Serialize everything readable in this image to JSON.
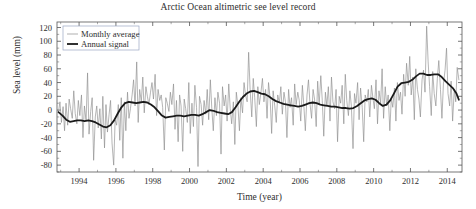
{
  "chart_data": {
    "type": "line",
    "title": "Arctic Ocean altimetric see level record",
    "xlabel": "Time (year)",
    "ylabel": "Sea level (mm)",
    "xlim": [
      1992.8,
      2014.8
    ],
    "ylim": [
      -90,
      128
    ],
    "grid": false,
    "legend_position": "top-left",
    "xticks": [
      1994,
      1996,
      1998,
      2000,
      2002,
      2004,
      2006,
      2008,
      2010,
      2012,
      2014
    ],
    "xtick_labels": [
      "1994",
      "1996",
      "1998",
      "2000",
      "2002",
      "2004",
      "2006",
      "2008",
      "2010",
      "2012",
      "2014"
    ],
    "yticks": [
      -80,
      -60,
      -40,
      -20,
      0,
      20,
      40,
      60,
      80,
      100,
      120
    ],
    "ytick_labels": [
      "-80",
      "-60",
      "-40",
      "-20",
      "0",
      "20",
      "40",
      "60",
      "80",
      "100",
      "120"
    ],
    "colors": {
      "monthly": "#8c8c8c",
      "annual": "#1a1a1a",
      "axis": "#555555",
      "background": "#ffffff"
    },
    "series": [
      {
        "name": "Monthly average",
        "style": "thin",
        "color": "#8c8c8c",
        "x": [
          1992.88,
          1992.96,
          1993.04,
          1993.13,
          1993.21,
          1993.29,
          1993.38,
          1993.46,
          1993.54,
          1993.63,
          1993.71,
          1993.79,
          1993.88,
          1993.96,
          1994.04,
          1994.13,
          1994.21,
          1994.29,
          1994.38,
          1994.46,
          1994.54,
          1994.63,
          1994.71,
          1994.79,
          1994.88,
          1994.96,
          1995.04,
          1995.13,
          1995.21,
          1995.29,
          1995.38,
          1995.46,
          1995.54,
          1995.63,
          1995.71,
          1995.79,
          1995.88,
          1995.96,
          1996.04,
          1996.13,
          1996.21,
          1996.29,
          1996.38,
          1996.46,
          1996.54,
          1996.63,
          1996.71,
          1996.79,
          1996.88,
          1996.96,
          1997.04,
          1997.13,
          1997.21,
          1997.29,
          1997.38,
          1997.46,
          1997.54,
          1997.63,
          1997.71,
          1997.79,
          1997.88,
          1997.96,
          1998.04,
          1998.13,
          1998.21,
          1998.29,
          1998.38,
          1998.46,
          1998.54,
          1998.63,
          1998.71,
          1998.79,
          1998.88,
          1998.96,
          1999.04,
          1999.13,
          1999.21,
          1999.29,
          1999.38,
          1999.46,
          1999.54,
          1999.63,
          1999.71,
          1999.79,
          1999.88,
          1999.96,
          2000.04,
          2000.13,
          2000.21,
          2000.29,
          2000.38,
          2000.46,
          2000.54,
          2000.63,
          2000.71,
          2000.79,
          2000.88,
          2000.96,
          2001.04,
          2001.13,
          2001.21,
          2001.29,
          2001.38,
          2001.46,
          2001.54,
          2001.63,
          2001.71,
          2001.79,
          2001.88,
          2001.96,
          2002.04,
          2002.13,
          2002.21,
          2002.29,
          2002.38,
          2002.46,
          2002.54,
          2002.63,
          2002.71,
          2002.79,
          2002.88,
          2002.96,
          2003.04,
          2003.13,
          2003.21,
          2003.29,
          2003.38,
          2003.46,
          2003.54,
          2003.63,
          2003.71,
          2003.79,
          2003.88,
          2003.96,
          2004.04,
          2004.13,
          2004.21,
          2004.29,
          2004.38,
          2004.46,
          2004.54,
          2004.63,
          2004.71,
          2004.79,
          2004.88,
          2004.96,
          2005.04,
          2005.13,
          2005.21,
          2005.29,
          2005.38,
          2005.46,
          2005.54,
          2005.63,
          2005.71,
          2005.79,
          2005.88,
          2005.96,
          2006.04,
          2006.13,
          2006.21,
          2006.29,
          2006.38,
          2006.46,
          2006.54,
          2006.63,
          2006.71,
          2006.79,
          2006.88,
          2006.96,
          2007.04,
          2007.13,
          2007.21,
          2007.29,
          2007.38,
          2007.46,
          2007.54,
          2007.63,
          2007.71,
          2007.79,
          2007.88,
          2007.96,
          2008.04,
          2008.13,
          2008.21,
          2008.29,
          2008.38,
          2008.46,
          2008.54,
          2008.63,
          2008.71,
          2008.79,
          2008.88,
          2008.96,
          2009.04,
          2009.13,
          2009.21,
          2009.29,
          2009.38,
          2009.46,
          2009.54,
          2009.63,
          2009.71,
          2009.79,
          2009.88,
          2009.96,
          2010.04,
          2010.13,
          2010.21,
          2010.29,
          2010.38,
          2010.46,
          2010.54,
          2010.63,
          2010.71,
          2010.79,
          2010.88,
          2010.96,
          2011.04,
          2011.13,
          2011.21,
          2011.29,
          2011.38,
          2011.46,
          2011.54,
          2011.63,
          2011.71,
          2011.79,
          2011.88,
          2011.96,
          2012.04,
          2012.13,
          2012.21,
          2012.29,
          2012.38,
          2012.46,
          2012.54,
          2012.63,
          2012.71,
          2012.79,
          2012.88,
          2012.96,
          2013.04,
          2013.13,
          2013.21,
          2013.29,
          2013.38,
          2013.46,
          2013.54,
          2013.63,
          2013.71,
          2013.79,
          2013.88,
          2013.96,
          2014.04,
          2014.13,
          2014.21,
          2014.29,
          2014.38,
          2014.46,
          2014.54,
          2014.63
        ],
        "values": [
          -3,
          12,
          -18,
          5,
          -30,
          10,
          -22,
          16,
          2,
          -12,
          28,
          -5,
          -20,
          14,
          -8,
          22,
          -40,
          6,
          -16,
          54,
          -35,
          -2,
          18,
          -73,
          -10,
          6,
          -26,
          2,
          -42,
          20,
          -55,
          8,
          -32,
          -6,
          14,
          -48,
          -80,
          -14,
          -22,
          8,
          -44,
          18,
          -70,
          12,
          -30,
          26,
          -12,
          2,
          22,
          44,
          6,
          70,
          -18,
          30,
          12,
          48,
          -4,
          34,
          20,
          8,
          26,
          40,
          16,
          52,
          -8,
          30,
          14,
          22,
          4,
          -58,
          18,
          10,
          -2,
          26,
          8,
          38,
          -28,
          14,
          -46,
          22,
          6,
          -60,
          16,
          2,
          -18,
          40,
          -34,
          10,
          -24,
          36,
          4,
          -82,
          20,
          8,
          -22,
          14,
          -6,
          30,
          -14,
          44,
          2,
          -30,
          18,
          -8,
          26,
          10,
          -64,
          34,
          6,
          22,
          -16,
          38,
          2,
          -20,
          12,
          -50,
          26,
          6,
          -30,
          18,
          -4,
          40,
          22,
          12,
          84,
          30,
          -10,
          46,
          18,
          -24,
          34,
          8,
          26,
          46,
          12,
          30,
          -12,
          40,
          16,
          -34,
          28,
          6,
          -18,
          22,
          10,
          34,
          -6,
          26,
          12,
          -40,
          30,
          4,
          18,
          -22,
          38,
          8,
          26,
          14,
          -16,
          36,
          6,
          -30,
          22,
          44,
          10,
          -12,
          30,
          16,
          -24,
          42,
          8,
          50,
          14,
          -38,
          26,
          6,
          34,
          -16,
          48,
          12,
          2,
          30,
          -46,
          20,
          10,
          36,
          -20,
          52,
          14,
          -8,
          28,
          6,
          -56,
          24,
          10,
          40,
          -14,
          32,
          4,
          -46,
          22,
          12,
          30,
          -10,
          36,
          18,
          2,
          44,
          -20,
          28,
          10,
          60,
          -12,
          34,
          6,
          22,
          -30,
          18,
          4,
          32,
          -16,
          40,
          14,
          26,
          -6,
          52,
          20,
          68,
          36,
          78,
          22,
          48,
          -14,
          60,
          30,
          16,
          -10,
          44,
          58,
          26,
          122,
          70,
          34,
          -8,
          56,
          24,
          6,
          46,
          72,
          30,
          -12,
          38,
          58,
          90,
          24,
          6,
          42,
          -16,
          30,
          12,
          62,
          44
        ]
      },
      {
        "name": "Annual signal",
        "style": "thick",
        "color": "#1a1a1a",
        "x": [
          1992.88,
          1993.1,
          1993.3,
          1993.5,
          1993.7,
          1993.9,
          1994.1,
          1994.3,
          1994.5,
          1994.7,
          1994.9,
          1995.1,
          1995.3,
          1995.5,
          1995.7,
          1995.9,
          1996.1,
          1996.3,
          1996.5,
          1996.7,
          1996.9,
          1997.1,
          1997.3,
          1997.5,
          1997.7,
          1997.9,
          1998.1,
          1998.3,
          1998.5,
          1998.7,
          1998.9,
          1999.1,
          1999.3,
          1999.5,
          1999.7,
          1999.9,
          2000.1,
          2000.3,
          2000.5,
          2000.7,
          2000.9,
          2001.1,
          2001.3,
          2001.5,
          2001.7,
          2001.9,
          2002.1,
          2002.3,
          2002.5,
          2002.7,
          2002.9,
          2003.1,
          2003.3,
          2003.5,
          2003.7,
          2003.9,
          2004.1,
          2004.3,
          2004.5,
          2004.7,
          2004.9,
          2005.1,
          2005.3,
          2005.5,
          2005.7,
          2005.9,
          2006.1,
          2006.3,
          2006.5,
          2006.7,
          2006.9,
          2007.1,
          2007.3,
          2007.5,
          2007.7,
          2007.9,
          2008.1,
          2008.3,
          2008.5,
          2008.7,
          2008.9,
          2009.1,
          2009.3,
          2009.5,
          2009.7,
          2009.9,
          2010.1,
          2010.3,
          2010.5,
          2010.7,
          2010.9,
          2011.1,
          2011.3,
          2011.5,
          2011.7,
          2011.9,
          2012.1,
          2012.3,
          2012.5,
          2012.7,
          2012.9,
          2013.1,
          2013.3,
          2013.5,
          2013.7,
          2013.9,
          2014.1,
          2014.3,
          2014.5,
          2014.63
        ],
        "values": [
          -3,
          -8,
          -14,
          -17,
          -16,
          -15,
          -15,
          -16,
          -15,
          -16,
          -18,
          -21,
          -24,
          -25,
          -22,
          -15,
          -5,
          4,
          10,
          12,
          11,
          10,
          11,
          12,
          11,
          8,
          4,
          -2,
          -8,
          -11,
          -10,
          -9,
          -8,
          -8,
          -9,
          -8,
          -7,
          -7,
          -8,
          -6,
          -3,
          0,
          -1,
          -3,
          -4,
          -5,
          -6,
          -3,
          4,
          12,
          19,
          24,
          27,
          28,
          26,
          24,
          23,
          20,
          16,
          13,
          11,
          9,
          8,
          7,
          6,
          5,
          6,
          8,
          10,
          11,
          10,
          8,
          7,
          6,
          5,
          5,
          4,
          3,
          3,
          2,
          3,
          6,
          10,
          14,
          16,
          17,
          15,
          10,
          6,
          8,
          14,
          24,
          34,
          39,
          40,
          41,
          44,
          49,
          53,
          53,
          51,
          51,
          52,
          52,
          48,
          42,
          37,
          32,
          24,
          15
        ]
      }
    ],
    "legend": [
      {
        "label": "Monthly average",
        "style": "thin",
        "color": "#8c8c8c"
      },
      {
        "label": "Annual signal",
        "style": "thick",
        "color": "#1a1a1a"
      }
    ]
  }
}
